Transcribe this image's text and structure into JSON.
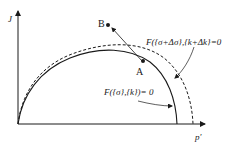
{
  "diagram": {
    "axes": {
      "y_label": "J",
      "x_label": "p'"
    },
    "points": {
      "a_label": "A",
      "b_label": "B"
    },
    "curves": {
      "initial_label": "F({σ},{k})= 0",
      "updated_label": "F({σ+Δσ},{k+Δk}=0"
    },
    "colors": {
      "stroke": "#1a1a1a",
      "background": "#ffffff"
    }
  }
}
